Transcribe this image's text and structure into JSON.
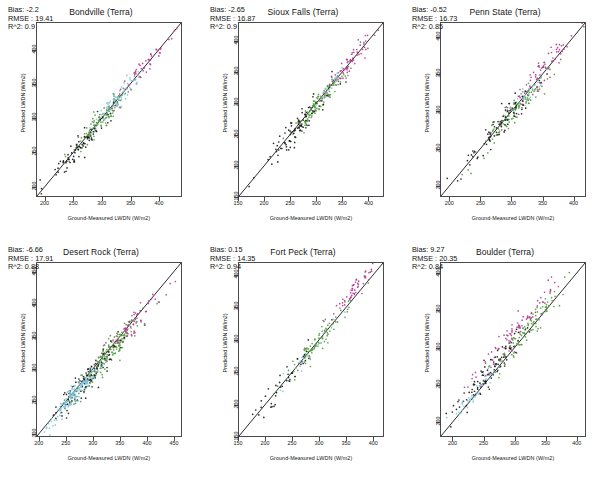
{
  "figure": {
    "axis_labels": {
      "x": "Ground-Measured LWDN (W/m2)",
      "y": "Predicted LWDN (W/m2)"
    },
    "stat_labels": {
      "bias": "Bias:",
      "rmse": "RMSE :",
      "r2": "R^2:"
    },
    "caption": ""
  },
  "colors": {
    "green": "#4f9b3a",
    "magenta": "#b8348f",
    "black": "#161616",
    "cyan": "#7fc3dd",
    "blue": "#3f5fae",
    "line": "#111111",
    "axis": "#4a4a4a"
  },
  "chart_data": [
    {
      "type": "scatter",
      "title": "Bondville (Terra)",
      "xlabel": "Ground-Measured LWDN (W/m2)",
      "ylabel": "Predicted LWDN (W/m2)",
      "xlim": [
        185,
        440
      ],
      "ylim": [
        185,
        440
      ],
      "xticks": [
        200,
        250,
        300,
        350,
        400
      ],
      "yticks": [
        200,
        250,
        300,
        350,
        400
      ],
      "grid": false,
      "legend": "none",
      "annotations": {
        "Bias": "-2.2",
        "RMSE": "19.41",
        "R^2": "0.9"
      },
      "reference_line": "1:1",
      "n_points": 320,
      "series": [
        {
          "name": "green",
          "color": "#4f9b3a",
          "count": 110,
          "x_center": 300,
          "y_center": 299,
          "spread": 26
        },
        {
          "name": "magenta",
          "color": "#b8348f",
          "count": 55,
          "x_center": 370,
          "y_center": 372,
          "spread": 28
        },
        {
          "name": "black",
          "color": "#161616",
          "count": 85,
          "x_center": 262,
          "y_center": 259,
          "spread": 30
        },
        {
          "name": "cyan",
          "color": "#7fc3dd",
          "count": 70,
          "x_center": 327,
          "y_center": 327,
          "spread": 22
        }
      ]
    },
    {
      "type": "scatter",
      "title": "Sioux Falls (Terra)",
      "xlabel": "Ground-Measured LWDN (W/m2)",
      "ylabel": "Predicted LWDN (W/m2)",
      "xlim": [
        150,
        430
      ],
      "ylim": [
        150,
        430
      ],
      "xticks": [
        150,
        200,
        250,
        300,
        350,
        400
      ],
      "yticks": [
        150,
        200,
        250,
        300,
        350,
        400
      ],
      "grid": false,
      "legend": "none",
      "annotations": {
        "Bias": "-2.65",
        "RMSE": "16.87",
        "R^2": "0.9"
      },
      "reference_line": "1:1",
      "n_points": 300,
      "series": [
        {
          "name": "green",
          "color": "#4f9b3a",
          "count": 115,
          "x_center": 310,
          "y_center": 305,
          "spread": 26
        },
        {
          "name": "magenta",
          "color": "#b8348f",
          "count": 70,
          "x_center": 365,
          "y_center": 365,
          "spread": 26
        },
        {
          "name": "black",
          "color": "#161616",
          "count": 95,
          "x_center": 265,
          "y_center": 263,
          "spread": 38
        },
        {
          "name": "cyan",
          "color": "#7fc3dd",
          "count": 20,
          "x_center": 330,
          "y_center": 330,
          "spread": 20
        }
      ]
    },
    {
      "type": "scatter",
      "title": "Penn State (Terra)",
      "xlabel": "Ground-Measured LWDN (W/m2)",
      "ylabel": "Predicted LWDN (W/m2)",
      "xlim": [
        185,
        420
      ],
      "ylim": [
        185,
        420
      ],
      "xticks": [
        200,
        250,
        300,
        350,
        400
      ],
      "yticks": [
        200,
        250,
        300,
        350,
        400
      ],
      "grid": false,
      "legend": "none",
      "annotations": {
        "Bias": "-0.52",
        "RMSE": "16.73",
        "R^2": "0.85"
      },
      "reference_line": "1:1",
      "n_points": 300,
      "series": [
        {
          "name": "green",
          "color": "#4f9b3a",
          "count": 120,
          "x_center": 300,
          "y_center": 296,
          "spread": 30
        },
        {
          "name": "magenta",
          "color": "#b8348f",
          "count": 75,
          "x_center": 348,
          "y_center": 350,
          "spread": 28
        },
        {
          "name": "black",
          "color": "#161616",
          "count": 80,
          "x_center": 280,
          "y_center": 279,
          "spread": 34
        },
        {
          "name": "cyan",
          "color": "#7fc3dd",
          "count": 25,
          "x_center": 320,
          "y_center": 320,
          "spread": 22
        }
      ]
    },
    {
      "type": "scatter",
      "title": "Desert Rock (Terra)",
      "xlabel": "Ground-Measured LWDN (W/m2)",
      "ylabel": "Predicted LWDN (W/m2)",
      "xlim": [
        195,
        465
      ],
      "ylim": [
        195,
        465
      ],
      "xticks": [
        200,
        250,
        300,
        350,
        400,
        450
      ],
      "yticks": [
        200,
        250,
        300,
        350,
        400,
        450
      ],
      "grid": false,
      "legend": "none",
      "annotations": {
        "Bias": "-6.66",
        "RMSE": "17.91",
        "R^2": "0.88"
      },
      "reference_line": "1:1",
      "n_points": 520,
      "series": [
        {
          "name": "green",
          "color": "#4f9b3a",
          "count": 190,
          "x_center": 330,
          "y_center": 324,
          "spread": 34
        },
        {
          "name": "magenta",
          "color": "#b8348f",
          "count": 70,
          "x_center": 370,
          "y_center": 364,
          "spread": 34
        },
        {
          "name": "black",
          "color": "#161616",
          "count": 110,
          "x_center": 285,
          "y_center": 280,
          "spread": 32
        },
        {
          "name": "cyan",
          "color": "#7fc3dd",
          "count": 150,
          "x_center": 265,
          "y_center": 259,
          "spread": 26
        }
      ]
    },
    {
      "type": "scatter",
      "title": "Fort Peck (Terra)",
      "xlabel": "Ground-Measured LWDN (W/m2)",
      "ylabel": "Predicted LWDN (W/m2)",
      "xlim": [
        150,
        420
      ],
      "ylim": [
        150,
        420
      ],
      "xticks": [
        150,
        200,
        250,
        300,
        350,
        400
      ],
      "yticks": [
        150,
        200,
        250,
        300,
        350,
        400
      ],
      "grid": false,
      "legend": "none",
      "annotations": {
        "Bias": "0.15",
        "RMSE": "14.35",
        "R^2": "0.94"
      },
      "reference_line": "1:1",
      "n_points": 210,
      "series": [
        {
          "name": "green",
          "color": "#4f9b3a",
          "count": 95,
          "x_center": 300,
          "y_center": 300,
          "spread": 32
        },
        {
          "name": "magenta",
          "color": "#b8348f",
          "count": 55,
          "x_center": 367,
          "y_center": 380,
          "spread": 22
        },
        {
          "name": "black",
          "color": "#161616",
          "count": 40,
          "x_center": 235,
          "y_center": 233,
          "spread": 32
        },
        {
          "name": "cyan",
          "color": "#7fc3dd",
          "count": 20,
          "x_center": 275,
          "y_center": 273,
          "spread": 24
        }
      ]
    },
    {
      "type": "scatter",
      "title": "Boulder (Terra)",
      "xlabel": "Ground-Measured LWDN (W/m2)",
      "ylabel": "Predicted LWDN (W/m2)",
      "xlim": [
        180,
        415
      ],
      "ylim": [
        180,
        415
      ],
      "xticks": [
        200,
        250,
        300,
        350,
        400
      ],
      "yticks": [
        200,
        250,
        300,
        350,
        400
      ],
      "grid": false,
      "legend": "none",
      "annotations": {
        "Bias": "9.27",
        "RMSE": "20.35",
        "R^2": "0.84"
      },
      "reference_line": "1:1",
      "n_points": 330,
      "series": [
        {
          "name": "green",
          "color": "#4f9b3a",
          "count": 110,
          "x_center": 318,
          "y_center": 322,
          "spread": 28
        },
        {
          "name": "magenta",
          "color": "#b8348f",
          "count": 85,
          "x_center": 300,
          "y_center": 322,
          "spread": 30
        },
        {
          "name": "black",
          "color": "#161616",
          "count": 95,
          "x_center": 262,
          "y_center": 270,
          "spread": 32
        },
        {
          "name": "cyan",
          "color": "#7fc3dd",
          "count": 40,
          "x_center": 242,
          "y_center": 243,
          "spread": 22
        }
      ]
    }
  ]
}
